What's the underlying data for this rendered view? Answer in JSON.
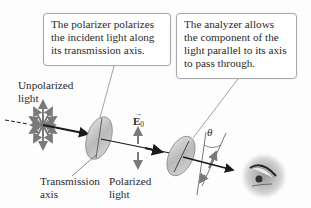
{
  "callouts": {
    "polarizer": {
      "lines": [
        "The polarizer polarizes",
        "the incident light along",
        "its transmission axis."
      ]
    },
    "analyzer": {
      "lines": [
        "The analyzer allows",
        "the component of the",
        "light parallel to its axis",
        "to pass through."
      ]
    }
  },
  "labels": {
    "unpolarized": [
      "Unpolarized",
      "light"
    ],
    "transmission_axis": [
      "Transmission",
      "axis"
    ],
    "polarized": [
      "Polarized",
      "light"
    ],
    "e_field": {
      "symbol": "E",
      "subscript": "0",
      "vector_mark": "→"
    },
    "angle": "θ"
  },
  "icons": {
    "unpolarized": "star-arrows-icon",
    "polarizer": "disk-filter",
    "analyzer": "disk-filter",
    "observer": "eye-icon"
  },
  "colors": {
    "beam": "#1a1a1a",
    "arrows": "#7a7a7a",
    "disk": "#c4c4c4",
    "callout_border": "#a8a8a8"
  }
}
